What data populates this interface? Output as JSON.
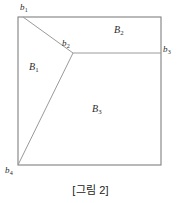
{
  "figure": {
    "caption": "[그림 2]",
    "stroke_color": "#9a9a9a",
    "border_color": "#808080",
    "text_color": "#2b2b2b",
    "background": "#ffffff",
    "vertices": [
      {
        "id": "b1",
        "label": "b",
        "sub": "1",
        "x": 23,
        "y": 17
      },
      {
        "id": "b2",
        "label": "b",
        "sub": "2",
        "x": 73,
        "y": 53
      },
      {
        "id": "b3",
        "label": "b",
        "sub": "3",
        "x": 161,
        "y": 53
      },
      {
        "id": "b4",
        "label": "b",
        "sub": "4",
        "x": 18,
        "y": 165
      }
    ],
    "regions": [
      {
        "id": "B1",
        "label": "B",
        "sub": "1"
      },
      {
        "id": "B2",
        "label": "B",
        "sub": "2"
      },
      {
        "id": "B3",
        "label": "B",
        "sub": "3"
      }
    ],
    "rectangle": {
      "x": 18,
      "y": 17,
      "width": 143,
      "height": 148
    },
    "edges": [
      {
        "id": "edge-b1-b2",
        "from": "b1",
        "to": "b2",
        "x1": 23,
        "y1": 17,
        "x2": 73,
        "y2": 53
      },
      {
        "id": "edge-b2-b3",
        "from": "b2",
        "to": "b3",
        "x1": 73,
        "y1": 53,
        "x2": 161,
        "y2": 53
      },
      {
        "id": "edge-b2-b4",
        "from": "b2",
        "to": "b4",
        "x1": 73,
        "y1": 53,
        "x2": 18,
        "y2": 165
      }
    ]
  },
  "chart_data": {
    "type": "diagram",
    "title": "[그림 2]",
    "boundary": {
      "shape": "square",
      "corners": [
        [
          18,
          17
        ],
        [
          161,
          17
        ],
        [
          161,
          165
        ],
        [
          18,
          165
        ]
      ]
    },
    "nodes": [
      {
        "name": "b1",
        "x": 23,
        "y": 17,
        "type": "boundary-vertex"
      },
      {
        "name": "b2",
        "x": 73,
        "y": 53,
        "type": "interior-vertex"
      },
      {
        "name": "b3",
        "x": 161,
        "y": 53,
        "type": "boundary-vertex"
      },
      {
        "name": "b4",
        "x": 18,
        "y": 165,
        "type": "boundary-vertex"
      }
    ],
    "edges": [
      [
        "b1",
        "b2"
      ],
      [
        "b2",
        "b3"
      ],
      [
        "b2",
        "b4"
      ]
    ],
    "faces": [
      {
        "name": "B1",
        "bounded_by": [
          "b1",
          "b2",
          "b4"
        ],
        "centroid": [
          36,
          68
        ]
      },
      {
        "name": "B2",
        "bounded_by": [
          "b1",
          "b2",
          "b3"
        ],
        "centroid": [
          121,
          31
        ]
      },
      {
        "name": "B3",
        "bounded_by": [
          "b2",
          "b3",
          "b4"
        ],
        "centroid": [
          100,
          110
        ]
      }
    ]
  }
}
